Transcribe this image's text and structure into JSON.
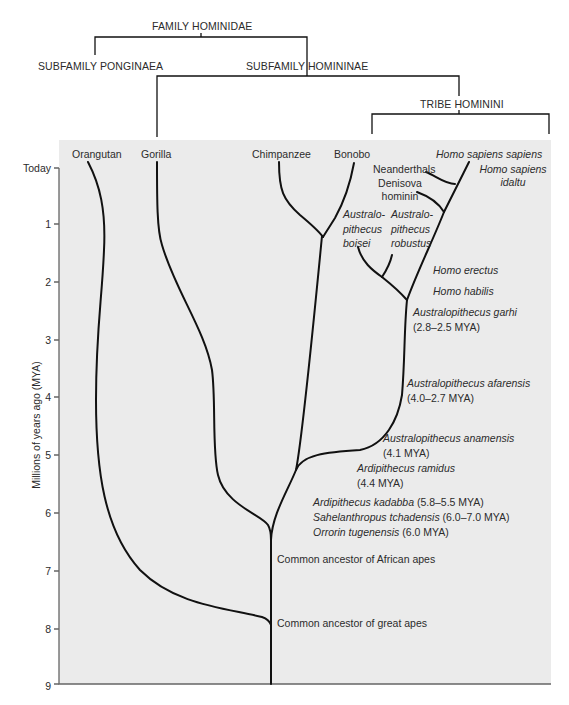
{
  "taxonomy": {
    "family": "FAMILY HOMINIDAE",
    "subfamily_left": "SUBFAMILY PONGINAEA",
    "subfamily_right": "SUBFAMILY HOMININAE",
    "tribe": "TRIBE HOMININI"
  },
  "axis": {
    "ylabel": "Millions of years ago (MYA)",
    "ticks": [
      "Today",
      "1",
      "2",
      "3",
      "4",
      "5",
      "6",
      "7",
      "8",
      "9"
    ]
  },
  "tips": {
    "orangutan": "Orangutan",
    "gorilla": "Gorilla",
    "chimpanzee": "Chimpanzee",
    "bonobo": "Bonobo",
    "homo_sapiens_sapiens": "Homo sapiens sapiens",
    "homo_sapiens_idaltu_1": "Homo sapiens",
    "homo_sapiens_idaltu_2": "idaltu",
    "neanderthals": "Neanderthals",
    "denisova_1": "Denisova",
    "denisova_2": "hominin",
    "boisei_1": "Australo-",
    "boisei_2": "pithecus",
    "boisei_3": "boisei",
    "robustus_1": "Australo-",
    "robustus_2": "pithecus",
    "robustus_3": "robustus"
  },
  "species": {
    "homo_erectus": "Homo erectus",
    "homo_habilis": "Homo habilis",
    "garhi_name": "Australopithecus garhi",
    "garhi_date": "(2.8–2.5 MYA)",
    "afarensis_name": "Australopithecus afarensis",
    "afarensis_date": "(4.0–2.7 MYA)",
    "anamensis_name": "Australopithecus anamensis",
    "anamensis_date": "(4.1 MYA)",
    "ramidus_name": "Ardipithecus ramidus",
    "ramidus_date": "(4.4 MYA)",
    "kadabba_name": "Ardipithecus kadabba",
    "kadabba_date": " (5.8–5.5 MYA)",
    "sahelanthropus_name": "Sahelanthropus tchadensis",
    "sahelanthropus_date": " (6.0–7.0 MYA)",
    "orrorin_name": "Orrorin tugenensis",
    "orrorin_date": " (6.0 MYA)"
  },
  "nodes": {
    "african_apes": "Common ancestor of African apes",
    "great_apes": "Common ancestor of great apes"
  },
  "colors": {
    "plot_background": "#ebebeb",
    "line": "#111111",
    "text": "#2b2b2b"
  }
}
